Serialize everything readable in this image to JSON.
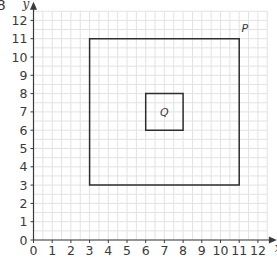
{
  "question_number": "8",
  "chart_data": {
    "type": "diagram-grid",
    "title": "",
    "xlabel": "x",
    "ylabel": "y",
    "xlim": [
      0,
      12
    ],
    "ylim": [
      0,
      12
    ],
    "x_ticks": [
      "0",
      "1",
      "2",
      "3",
      "4",
      "5",
      "6",
      "7",
      "8",
      "9",
      "10",
      "11",
      "12"
    ],
    "y_ticks": [
      "0",
      "1",
      "2",
      "3",
      "4",
      "5",
      "6",
      "7",
      "8",
      "9",
      "10",
      "11",
      "12"
    ],
    "grid": true,
    "shapes": [
      {
        "name": "P",
        "label": "P",
        "vertices": [
          [
            3,
            3
          ],
          [
            11,
            3
          ],
          [
            11,
            11
          ],
          [
            3,
            11
          ]
        ],
        "label_pos": [
          11.3,
          11.6
        ]
      },
      {
        "name": "Q",
        "label": "Q",
        "vertices": [
          [
            6,
            6
          ],
          [
            8,
            6
          ],
          [
            8,
            8
          ],
          [
            6,
            8
          ]
        ],
        "label_pos": [
          7,
          7
        ]
      }
    ]
  }
}
